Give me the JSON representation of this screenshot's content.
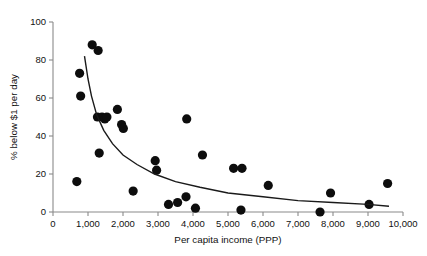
{
  "chart_data": {
    "type": "scatter",
    "title": "",
    "xlabel": "Per capita income (PPP)",
    "ylabel": "% below $1 per day",
    "xlim": [
      0,
      10000
    ],
    "ylim": [
      0,
      100
    ],
    "grid": false,
    "legend": null,
    "xticks": [
      0,
      1000,
      2000,
      3000,
      4000,
      5000,
      6000,
      7000,
      8000,
      9000,
      10000
    ],
    "xticklabels": [
      "0",
      "1,000",
      "2,000",
      "3,000",
      "4,000",
      "5,000",
      "6,000",
      "7,000",
      "8,000",
      "9,000",
      "10,000"
    ],
    "yticks": [
      0,
      20,
      40,
      60,
      80,
      100
    ],
    "yticklabels": [
      "0",
      "20",
      "40",
      "60",
      "80",
      "100"
    ],
    "marker": "filled-circle",
    "marker_color": "#0d0d0d",
    "marker_size": 4.6,
    "points": [
      {
        "x": 760,
        "y": 73
      },
      {
        "x": 790,
        "y": 61
      },
      {
        "x": 680,
        "y": 16
      },
      {
        "x": 1120,
        "y": 88
      },
      {
        "x": 1290,
        "y": 85
      },
      {
        "x": 1270,
        "y": 50
      },
      {
        "x": 1400,
        "y": 50
      },
      {
        "x": 1480,
        "y": 49
      },
      {
        "x": 1540,
        "y": 50
      },
      {
        "x": 1320,
        "y": 31
      },
      {
        "x": 1840,
        "y": 54
      },
      {
        "x": 1960,
        "y": 46
      },
      {
        "x": 2010,
        "y": 44
      },
      {
        "x": 2290,
        "y": 11
      },
      {
        "x": 2920,
        "y": 27
      },
      {
        "x": 2960,
        "y": 22
      },
      {
        "x": 3300,
        "y": 4
      },
      {
        "x": 3560,
        "y": 5
      },
      {
        "x": 3800,
        "y": 8
      },
      {
        "x": 3820,
        "y": 49
      },
      {
        "x": 4070,
        "y": 2
      },
      {
        "x": 4270,
        "y": 30
      },
      {
        "x": 5160,
        "y": 23
      },
      {
        "x": 5400,
        "y": 23
      },
      {
        "x": 5370,
        "y": 1
      },
      {
        "x": 6150,
        "y": 14
      },
      {
        "x": 7630,
        "y": 0
      },
      {
        "x": 7930,
        "y": 10
      },
      {
        "x": 9030,
        "y": 4
      },
      {
        "x": 9560,
        "y": 15
      }
    ],
    "fit_curve": {
      "description": "decreasing hyperbolic trend line",
      "color": "#1a1a1a",
      "points": [
        {
          "x": 900,
          "y": 82
        },
        {
          "x": 1000,
          "y": 70
        },
        {
          "x": 1100,
          "y": 61
        },
        {
          "x": 1250,
          "y": 51
        },
        {
          "x": 1450,
          "y": 43
        },
        {
          "x": 1700,
          "y": 36
        },
        {
          "x": 2000,
          "y": 30
        },
        {
          "x": 2400,
          "y": 25
        },
        {
          "x": 2900,
          "y": 20
        },
        {
          "x": 3500,
          "y": 16
        },
        {
          "x": 4200,
          "y": 13
        },
        {
          "x": 5000,
          "y": 10
        },
        {
          "x": 6000,
          "y": 8
        },
        {
          "x": 7000,
          "y": 6
        },
        {
          "x": 8000,
          "y": 5
        },
        {
          "x": 9000,
          "y": 4
        },
        {
          "x": 9600,
          "y": 3
        }
      ]
    }
  }
}
